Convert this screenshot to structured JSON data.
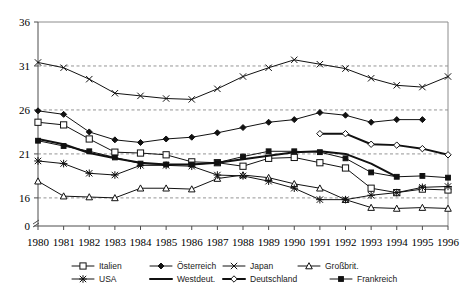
{
  "chart_data": {
    "type": "line",
    "title": "",
    "xlabel": "",
    "ylabel": "",
    "x": [
      1980,
      1981,
      1982,
      1983,
      1984,
      1985,
      1986,
      1987,
      1988,
      1989,
      1990,
      1991,
      1992,
      1993,
      1994,
      1995,
      1996
    ],
    "xtick_labels": [
      "1980",
      "1981",
      "1982",
      "1983",
      "1984",
      "1985",
      "1986",
      "1987",
      "1988",
      "1989",
      "1990",
      "1991",
      "1992",
      "1993",
      "1994",
      "1995",
      "1996"
    ],
    "ytick_labels": [
      "36",
      "31",
      "26",
      "21",
      "16",
      "0"
    ],
    "ytick_values": [
      36,
      31,
      26,
      21,
      16,
      0
    ],
    "ylim": [
      13.6,
      36
    ],
    "y_axis_break": true,
    "grid": "horizontal-dashed",
    "legend_position": "bottom",
    "series": [
      {
        "name": "Italien",
        "marker": "open-square",
        "line": "thin",
        "values": [
          24.6,
          24.3,
          22.7,
          21.2,
          21.1,
          20.9,
          20.1,
          20.0,
          19.6,
          20.5,
          20.6,
          20.0,
          19.4,
          17.1,
          16.6,
          17.0,
          16.9
        ]
      },
      {
        "name": "Österreich",
        "marker": "solid-diamond",
        "line": "thin",
        "values": [
          25.9,
          25.5,
          23.5,
          22.6,
          22.3,
          22.7,
          22.9,
          23.4,
          24.0,
          24.6,
          24.9,
          25.7,
          25.4,
          24.6,
          24.9,
          24.9,
          null
        ]
      },
      {
        "name": "Japan",
        "marker": "cross-x",
        "line": "thin",
        "values": [
          31.4,
          30.8,
          29.5,
          27.9,
          27.6,
          27.3,
          27.2,
          28.4,
          29.8,
          30.8,
          31.7,
          31.2,
          30.7,
          29.6,
          28.8,
          28.6,
          29.8
        ]
      },
      {
        "name": "Großbrit.",
        "marker": "open-triangle",
        "line": "thin",
        "values": [
          17.9,
          16.2,
          16.1,
          16.0,
          17.1,
          17.1,
          17.0,
          18.2,
          18.6,
          18.3,
          17.6,
          17.1,
          15.8,
          14.9,
          14.8,
          14.9,
          14.8
        ]
      },
      {
        "name": "USA",
        "marker": "star",
        "line": "thin",
        "values": [
          20.2,
          19.9,
          18.8,
          18.6,
          19.7,
          19.7,
          19.6,
          18.6,
          18.5,
          17.9,
          17.1,
          15.8,
          15.8,
          16.3,
          16.6,
          17.2,
          17.3
        ]
      },
      {
        "name": "Westdeut.",
        "marker": "none",
        "line": "thick",
        "values": [
          22.7,
          22.1,
          21.1,
          20.5,
          20.0,
          19.8,
          19.8,
          20.0,
          20.4,
          20.8,
          21.2,
          21.3,
          21.0,
          19.9,
          18.4,
          null,
          null
        ]
      },
      {
        "name": "Deutschland",
        "marker": "open-diamond",
        "line": "thick",
        "values": [
          null,
          null,
          null,
          null,
          null,
          null,
          null,
          null,
          null,
          null,
          null,
          23.3,
          23.3,
          22.1,
          22.0,
          21.6,
          20.9
        ]
      },
      {
        "name": "Frankreich",
        "marker": "solid-square",
        "line": "thin",
        "values": [
          22.5,
          21.9,
          21.3,
          20.6,
          19.9,
          19.8,
          19.8,
          20.0,
          20.7,
          21.3,
          21.3,
          21.2,
          20.5,
          18.9,
          18.4,
          18.5,
          18.3
        ]
      }
    ]
  },
  "legend": {
    "row1": [
      "Italien",
      "Österreich",
      "Japan",
      "Großbrit."
    ],
    "row2": [
      "USA",
      "Westdeut.",
      "Deutschland",
      "Frankreich"
    ]
  }
}
